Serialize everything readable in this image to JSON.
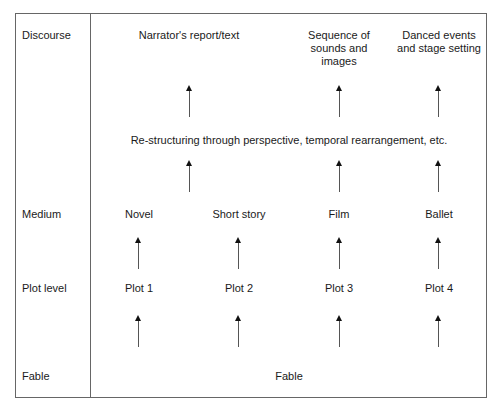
{
  "diagram": {
    "levels": [
      "Discourse",
      "Medium",
      "Plot level",
      "Fable"
    ],
    "discourse_items": [
      "Narrator's report/text",
      "Sequence of\nsounds and\nimages",
      "Danced events\nand stage setting"
    ],
    "restructuring": "Re-structuring through perspective, temporal rearrangement, etc.",
    "media": [
      "Novel",
      "Short story",
      "Film",
      "Ballet"
    ],
    "plots": [
      "Plot 1",
      "Plot 2",
      "Plot 3",
      "Plot 4"
    ],
    "fable": "Fable"
  }
}
